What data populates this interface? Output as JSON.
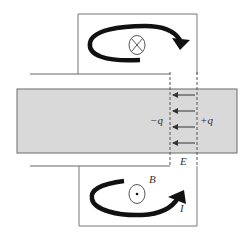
{
  "figure": {
    "labels": {
      "neg_charge": "−q",
      "pos_charge": "+q",
      "electric_field": "E",
      "magnetic_field": "B",
      "current": "I"
    },
    "top_symbol": "into-page-cross",
    "bottom_symbol": "out-of-page-dot",
    "colors": {
      "bar_fill": "#d8d8d8",
      "bar_stroke": "#6a6a6a",
      "line": "#666666",
      "arrow": "#111111"
    },
    "field_arrow_count": 4
  }
}
